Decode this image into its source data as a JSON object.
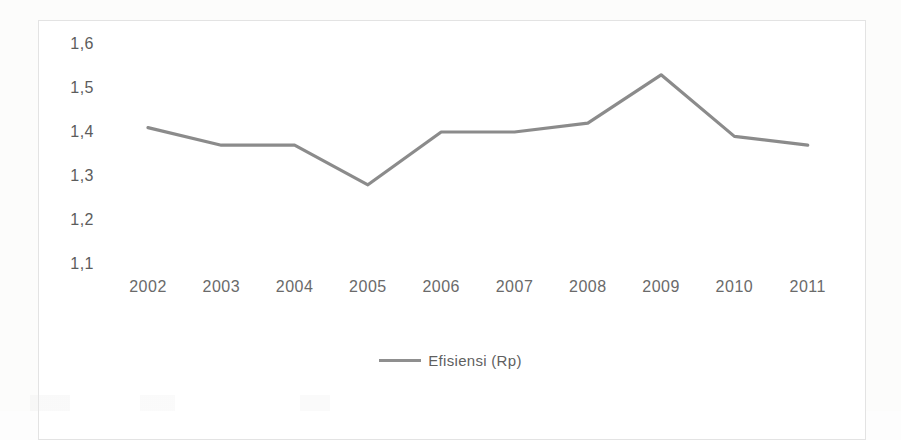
{
  "chart_data": {
    "type": "line",
    "title": "",
    "subtitle": "",
    "xlabel": "",
    "ylabel": "",
    "categories": [
      "2002",
      "2003",
      "2004",
      "2005",
      "2006",
      "2007",
      "2008",
      "2009",
      "2010",
      "2011"
    ],
    "series": [
      {
        "name": "Efisiensi (Rp)",
        "values": [
          1.41,
          1.37,
          1.37,
          1.28,
          1.4,
          1.4,
          1.42,
          1.53,
          1.39,
          1.37
        ],
        "color": "#7b7b7b"
      }
    ],
    "ylim": [
      1.1,
      1.6
    ],
    "ytick_labels": [
      "1,6",
      "1,5",
      "1,4",
      "1,3",
      "1,2",
      "1,1"
    ],
    "ytick_values": [
      1.6,
      1.5,
      1.4,
      1.3,
      1.2,
      1.1
    ],
    "grid": false,
    "legend_position": "bottom",
    "legend_entries": [
      "Efisiensi (Rp)"
    ],
    "decimal_separator": ",",
    "frame_color": "#e3e3e3",
    "background_color": "#ffffff",
    "line_color": "#7b7b7b",
    "axis_text_color": "#5c5c5c"
  },
  "legend": {
    "marker_name": "line-marker",
    "label": "Efisiensi (Rp)"
  }
}
